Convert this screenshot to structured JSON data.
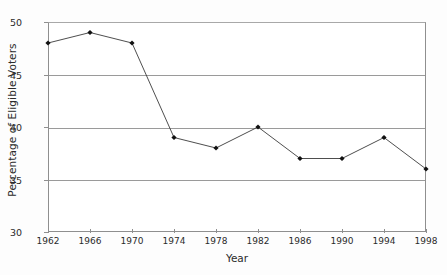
{
  "chart_data": {
    "type": "line",
    "title": "",
    "xlabel": "Year",
    "ylabel": "Percentage of Eligible Voters",
    "categories": [
      "1962",
      "1966",
      "1970",
      "1974",
      "1978",
      "1982",
      "1986",
      "1990",
      "1994",
      "1998"
    ],
    "x": [
      1962,
      1966,
      1970,
      1974,
      1978,
      1982,
      1986,
      1990,
      1994,
      1998
    ],
    "values": [
      48,
      49,
      48,
      39,
      38,
      40,
      37,
      37,
      39,
      36
    ],
    "series": [
      {
        "name": "Percentage of Eligible Voters",
        "values": [
          48,
          49,
          48,
          39,
          38,
          40,
          37,
          37,
          39,
          36
        ]
      }
    ],
    "xlim": [
      1962,
      1998
    ],
    "ylim": [
      30,
      50
    ],
    "yticks": [
      30,
      35,
      40,
      45,
      50
    ],
    "ytick_labels": [
      "30",
      "35",
      "40",
      "45",
      "50"
    ],
    "xticks": [
      1962,
      1966,
      1970,
      1974,
      1978,
      1982,
      1986,
      1990,
      1994,
      1998
    ],
    "xtick_labels": [
      "1962",
      "1966",
      "1970",
      "1974",
      "1978",
      "1982",
      "1986",
      "1990",
      "1994",
      "1998"
    ],
    "grid": "horizontal",
    "legend": "none",
    "marker": "diamond",
    "line_color": "#3a3a3a",
    "marker_color": "#111111",
    "grid_color": "#9a9a9a",
    "axis_color": "#8f8f8f",
    "background_color": "#ffffff",
    "text_color": "#2b2b2b"
  }
}
